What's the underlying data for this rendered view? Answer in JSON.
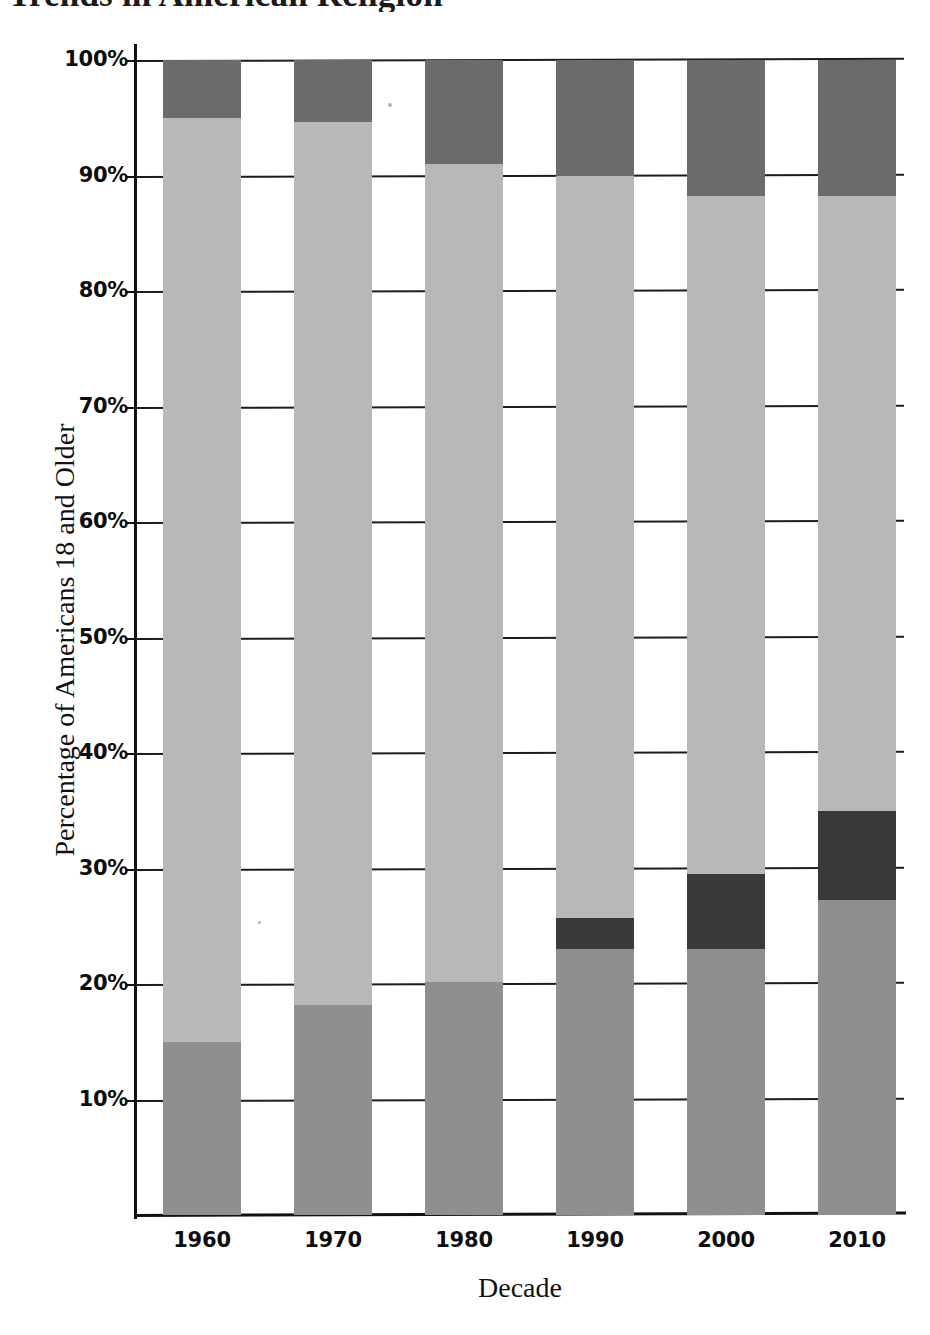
{
  "chart_data": {
    "type": "bar",
    "subtype": "stacked-bar",
    "title": "Trends in American Religion",
    "xlabel": "Decade",
    "ylabel": "Percentage of Americans 18 and Older",
    "categories": [
      "1960",
      "1970",
      "1980",
      "1990",
      "2000",
      "2010"
    ],
    "x_tick_labels": [
      "1960",
      "1970",
      "1980",
      "1990",
      "2000",
      "2010"
    ],
    "y_tick_labels": [
      "100%",
      "90%",
      "80%",
      "70%",
      "60%",
      "50%",
      "40%",
      "30%",
      "20%",
      "10%"
    ],
    "y_tick_values": [
      100,
      90,
      80,
      70,
      60,
      50,
      40,
      30,
      20,
      10
    ],
    "ylim": [
      0,
      100
    ],
    "grid": true,
    "legend": "none",
    "stack_order": "bottom-to-top",
    "series": [
      {
        "name": "segment-1-bottom",
        "color": "#8f8f8f",
        "values": [
          15.0,
          18.2,
          20.2,
          23.0,
          23.0,
          27.3
        ]
      },
      {
        "name": "segment-2-darkest",
        "color": "#3a3a3a",
        "values": [
          0.0,
          0.0,
          0.0,
          2.7,
          6.5,
          7.7
        ]
      },
      {
        "name": "segment-3-light",
        "color": "#b8b8b8",
        "values": [
          80.0,
          76.4,
          70.8,
          64.3,
          58.7,
          53.2
        ]
      },
      {
        "name": "segment-4-top",
        "color": "#6b6b6b",
        "values": [
          5.0,
          5.4,
          9.0,
          10.0,
          11.8,
          11.8
        ]
      }
    ],
    "cumulative_tops": {
      "1960": [
        15.0,
        15.0,
        95.0,
        100.0
      ],
      "1970": [
        18.2,
        18.2,
        94.6,
        100.0
      ],
      "1980": [
        20.2,
        20.2,
        91.0,
        100.0
      ],
      "1990": [
        23.0,
        25.7,
        90.0,
        100.0
      ],
      "2000": [
        23.0,
        29.5,
        88.2,
        100.0
      ],
      "2010": [
        27.3,
        35.0,
        88.2,
        100.0
      ]
    }
  },
  "colors": {
    "segment_bottom": "#8f8f8f",
    "segment_darkest": "#3a3a3a",
    "segment_light": "#b8b8b8",
    "segment_top": "#6b6b6b",
    "axis": "#111111",
    "gridline": "#1c1c1c",
    "background": "#ffffff",
    "text": "#0d0d0d"
  }
}
